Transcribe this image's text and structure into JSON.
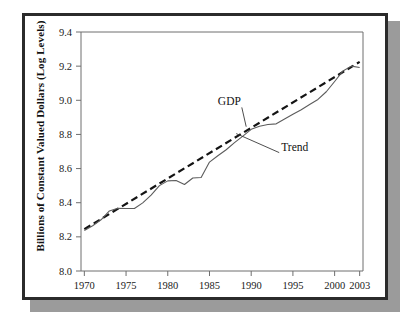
{
  "figure": {
    "y_axis_title": "Billions of Constant Valued Dollars (Log Levels)",
    "frame_color": "#2b2b2b",
    "shadow_color": "#9b9b9b",
    "background_color": "#ffffff"
  },
  "chart_data": {
    "type": "line",
    "title": "",
    "subtitle": "",
    "xlabel": "",
    "ylabel": "Billions of Constant Valued Dollars (Log Levels)",
    "xlim": [
      1969.6,
      2003.4
    ],
    "ylim": [
      8.0,
      9.4
    ],
    "grid": false,
    "legend_position": "inline-annotations",
    "xticks": [
      1970,
      1975,
      1980,
      1985,
      1990,
      1995,
      2000,
      2003
    ],
    "xtick_labels": [
      "1970",
      "1975",
      "1980",
      "1985",
      "1990",
      "1995",
      "2000",
      "2003"
    ],
    "yticks": [
      8.0,
      8.2,
      8.4,
      8.6,
      8.8,
      9.0,
      9.2,
      9.4
    ],
    "ytick_labels": [
      "8.0",
      "8.2",
      "8.4",
      "8.6",
      "8.8",
      "9.0",
      "9.2",
      "9.4"
    ],
    "annotations": [
      {
        "text": "GDP",
        "x": 1986.0,
        "y": 8.97,
        "points_to_x": 1989.4,
        "points_to_y": 8.845
      },
      {
        "text": "Trend",
        "x": 1993.6,
        "y": 8.705,
        "points_to_x": 1988.2,
        "points_to_y": 8.805
      }
    ],
    "series": [
      {
        "name": "GDP",
        "style": "solid",
        "color": "#5c5c5c",
        "x": [
          1970,
          1971,
          1972,
          1973,
          1974,
          1975,
          1976,
          1977,
          1978,
          1979,
          1980,
          1981,
          1982,
          1983,
          1984,
          1985,
          1986,
          1987,
          1988,
          1989,
          1990,
          1991,
          1992,
          1993,
          1994,
          1995,
          1996,
          1997,
          1998,
          1999,
          2000,
          2001,
          2002,
          2003
        ],
        "values": [
          8.237,
          8.265,
          8.3,
          8.352,
          8.368,
          8.366,
          8.366,
          8.399,
          8.444,
          8.5,
          8.528,
          8.53,
          8.507,
          8.545,
          8.548,
          8.638,
          8.675,
          8.71,
          8.752,
          8.79,
          8.83,
          8.848,
          8.858,
          8.862,
          8.89,
          8.918,
          8.945,
          8.975,
          9.005,
          9.05,
          9.11,
          9.172,
          9.2,
          9.192
        ]
      },
      {
        "name": "Trend",
        "style": "dashed",
        "color": "#141414",
        "x": [
          1970,
          2003
        ],
        "values": [
          8.245,
          9.225
        ]
      }
    ]
  }
}
